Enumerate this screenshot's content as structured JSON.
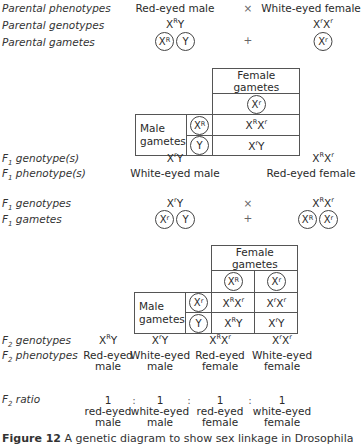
{
  "parental": {
    "phenotypes_label": "Parental phenotypes",
    "genotypes_label": "Parental genotypes",
    "gametes_label": "Parental gametes",
    "male_phenotype": "Red-eyed male",
    "cross_symbol": "×",
    "female_phenotype": "White-eyed female",
    "male_genotype": {
      "base1": "X",
      "sup1": "R",
      "base2": "Y"
    },
    "female_genotype": {
      "base1": "X",
      "sup1": "r",
      "base2": "X",
      "sup2": "r"
    },
    "male_gametes": [
      {
        "base": "X",
        "sup": "R"
      },
      {
        "base": "Y",
        "sup": ""
      }
    ],
    "plus_symbol": "+",
    "female_gametes": [
      {
        "base": "X",
        "sup": "r"
      }
    ]
  },
  "punnett1": {
    "female_header": "Female gametes",
    "female_gamete": {
      "base": "X",
      "sup": "r"
    },
    "male_header_line1": "Male",
    "male_header_line2": "gametes",
    "male_gametes": [
      {
        "base": "X",
        "sup": "R"
      },
      {
        "base": "Y",
        "sup": ""
      }
    ],
    "cells": [
      {
        "b1": "X",
        "s1": "R",
        "b2": "X",
        "s2": "r"
      },
      {
        "b1": "X",
        "s1": "r",
        "b2": "Y",
        "s2": ""
      }
    ]
  },
  "f1": {
    "genotype_label_prefix": "F",
    "genotype_label_sub": "1",
    "genotype_label": " genotype(s)",
    "phenotype_label": " phenotype(s)",
    "male_genotype": {
      "b1": "X",
      "s1": "r",
      "b2": "Y"
    },
    "female_genotype": {
      "b1": "X",
      "s1": "R",
      "b2": "X",
      "s2": "r"
    },
    "male_phenotype": "White-eyed male",
    "female_phenotype": "Red-eyed female",
    "cross_genotypes_label": " genotypes",
    "gametes_label": " gametes",
    "cross_symbol": "×",
    "plus_symbol": "+",
    "male_gametes": [
      {
        "base": "X",
        "sup": "r"
      },
      {
        "base": "Y",
        "sup": ""
      }
    ],
    "female_gametes": [
      {
        "base": "X",
        "sup": "R"
      },
      {
        "base": "X",
        "sup": "r"
      }
    ]
  },
  "punnett2": {
    "female_header": "Female gametes",
    "female_gametes": [
      {
        "base": "X",
        "sup": "R"
      },
      {
        "base": "X",
        "sup": "r"
      }
    ],
    "male_header_line1": "Male",
    "male_header_line2": "gametes",
    "male_gametes": [
      {
        "base": "X",
        "sup": "r"
      },
      {
        "base": "Y",
        "sup": ""
      }
    ],
    "cells": [
      [
        {
          "b1": "X",
          "s1": "R",
          "b2": "X",
          "s2": "r"
        },
        {
          "b1": "X",
          "s1": "r",
          "b2": "X",
          "s2": "r"
        }
      ],
      [
        {
          "b1": "X",
          "s1": "R",
          "b2": "Y",
          "s2": ""
        },
        {
          "b1": "X",
          "s1": "r",
          "b2": "Y",
          "s2": ""
        }
      ]
    ]
  },
  "f2": {
    "label_prefix": "F",
    "label_sub": "2",
    "genotypes_label": " genotypes",
    "phenotypes_label": " phenotypes",
    "ratio_label": " ratio",
    "genotypes": [
      {
        "b1": "X",
        "s1": "R",
        "b2": "Y",
        "s2": ""
      },
      {
        "b1": "X",
        "s1": "r",
        "b2": "Y",
        "s2": ""
      },
      {
        "b1": "X",
        "s1": "R",
        "b2": "X",
        "s2": "r"
      },
      {
        "b1": "X",
        "s1": "r",
        "b2": "X",
        "s2": "r"
      }
    ],
    "phenotypes": [
      {
        "line1": "Red-eyed",
        "line2": "male"
      },
      {
        "line1": "White-eyed",
        "line2": "male"
      },
      {
        "line1": "Red-eyed",
        "line2": "female"
      },
      {
        "line1": "White-eyed",
        "line2": "female"
      }
    ],
    "ratio": [
      {
        "n": "1",
        "line1": "red-eyed",
        "line2": "male"
      },
      {
        "n": "1",
        "line1": "white-eyed",
        "line2": "male"
      },
      {
        "n": "1",
        "line1": "red-eyed",
        "line2": "female"
      },
      {
        "n": "1",
        "line1": "white-eyed",
        "line2": "female"
      }
    ],
    "ratio_separator": ":"
  },
  "caption": {
    "figure_label": "Figure 12",
    "text": " A genetic diagram to show sex linkage in Drosophila"
  }
}
